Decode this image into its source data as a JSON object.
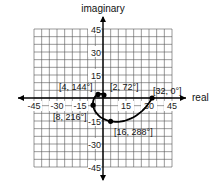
{
  "chart_data": {
    "type": "scatter",
    "title": "",
    "xlabel": "real",
    "ylabel": "imaginary",
    "xlim": [
      -45,
      45
    ],
    "ylim": [
      -45,
      45
    ],
    "grid": true,
    "grid_step": 5,
    "x_ticks": [
      -45,
      -30,
      -15,
      15,
      30,
      45
    ],
    "y_ticks": [
      45,
      30,
      15,
      -15,
      -30,
      -45
    ],
    "x_tick_labels": [
      "-45",
      "-30",
      "-15",
      "15",
      "30",
      "45"
    ],
    "y_tick_labels": [
      "45",
      "30",
      "15",
      "-15",
      "-30",
      "-45"
    ],
    "series": [
      {
        "name": "spiral",
        "format": "polar [r, theta]",
        "points": [
          {
            "label": "[2, 72°]",
            "r": 2,
            "theta_deg": 72,
            "x": 0.62,
            "y": 1.9
          },
          {
            "label": "[4, 144°]",
            "r": 4,
            "theta_deg": 144,
            "x": -3.24,
            "y": 2.35
          },
          {
            "label": "[8, 216°]",
            "r": 8,
            "theta_deg": 216,
            "x": -6.47,
            "y": -4.7
          },
          {
            "label": "[16, 288°]",
            "r": 16,
            "theta_deg": 288,
            "x": 4.94,
            "y": -15.22
          },
          {
            "label": "[32, 0°]",
            "r": 32,
            "theta_deg": 0,
            "x": 32,
            "y": 0
          }
        ]
      }
    ],
    "legend": null
  },
  "labels": {
    "x_axis": "real",
    "y_axis": "imaginary",
    "p1": "[2, 72°]",
    "p2": "[4, 144°]",
    "p3": "[8, 216°]",
    "p4": "[16, 288°]",
    "p5": "[32, 0°]"
  }
}
